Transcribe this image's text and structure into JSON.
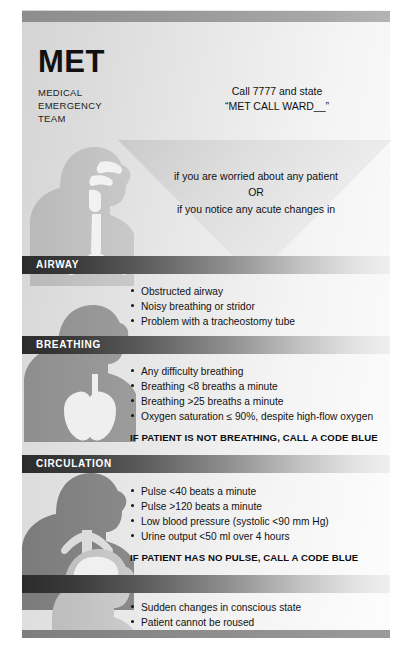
{
  "poster": {
    "title": "MET",
    "subtitle_lines": [
      "MEDICAL",
      "EMERGENCY",
      "TEAM"
    ],
    "call_instruction": {
      "line1": "Call 7777 and state",
      "line2": "“MET CALL WARD__”"
    },
    "trigger": {
      "line1": "if you are worried about any patient",
      "line2": "OR",
      "line3": "if you notice any acute changes in"
    },
    "colors": {
      "band_dark": "#2b2b2b",
      "band_light": "#efefef",
      "rule_bar": "#9a9a9a",
      "text": "#121212",
      "band_label": "#ffffff"
    },
    "sections": [
      {
        "id": "airway",
        "label": "AIRWAY",
        "figure": "head-neck-airway-silhouette",
        "bullets": [
          "Obstructed airway",
          "Noisy breathing or stridor",
          "Problem with a tracheostomy tube"
        ],
        "warning": ""
      },
      {
        "id": "breathing",
        "label": "BREATHING",
        "figure": "torso-lungs-silhouette",
        "bullets": [
          "Any difficulty breathing",
          "Breathing <8 breaths a minute",
          "Breathing >25 breaths a minute",
          "Oxygen saturation ≤ 90%, despite high-flow oxygen"
        ],
        "warning": "IF PATIENT IS NOT BREATHING, CALL A CODE BLUE"
      },
      {
        "id": "circulation",
        "label": "CIRCULATION",
        "figure": "torso-heart-vessels-silhouette",
        "bullets": [
          "Pulse <40 beats a minute",
          "Pulse >120 beats a minute",
          "Low blood pressure (systolic <90 mm Hg)",
          "Urine output <50 ml over 4 hours"
        ],
        "warning": "IF PATIENT HAS NO PULSE, CALL A CODE BLUE"
      },
      {
        "id": "neurological",
        "label": "",
        "figure": "head-brain-silhouette",
        "bullets": [
          "Sudden changes in conscious state",
          "Patient cannot be roused"
        ],
        "warning": ""
      }
    ]
  }
}
